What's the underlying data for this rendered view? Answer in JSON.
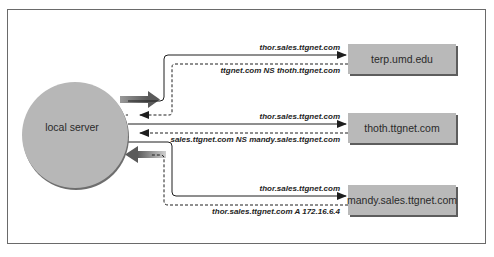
{
  "diagram": {
    "colors": {
      "node_fill": "#b9b9b9",
      "node_shadow": "#5d5d5d",
      "line": "#1e1e1e",
      "frame": "#6a6a6a"
    },
    "local_server": {
      "label": "local server"
    },
    "servers": [
      {
        "label": "terp.umd.edu",
        "query": "thor.sales.ttgnet.com",
        "response": "ttgnet.com  NS thoth.ttgnet.com"
      },
      {
        "label": "thoth.ttgnet.com",
        "query": "thor.sales.ttgnet.com",
        "response": "sales.ttgnet.com  NS mandy.sales.ttgnet.com"
      },
      {
        "label": "mandy.sales.ttgnet.com",
        "query": "thor.sales.ttgnet.com",
        "response": "thor.sales.ttgnet.com  A 172.16.6.4"
      }
    ],
    "legend": {
      "solid_line": "query",
      "dashed_line": "response",
      "wide_arrow_out": "initial query",
      "wide_arrow_in": "final answer"
    }
  }
}
